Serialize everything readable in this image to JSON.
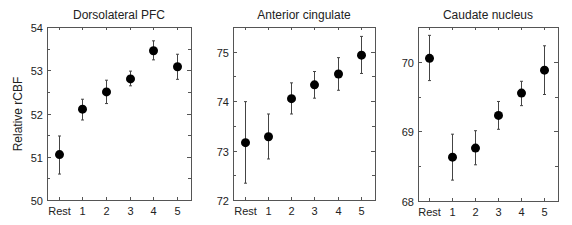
{
  "figure": {
    "ylabel": "Relative rCBF"
  },
  "chart_data": [
    {
      "type": "scatter",
      "title": "Dorsolateral PFC",
      "xlabel": "",
      "ylabel": "Relative rCBF",
      "categories": [
        "Rest",
        "1",
        "2",
        "3",
        "4",
        "5"
      ],
      "values": [
        51.05,
        52.1,
        52.5,
        52.8,
        53.45,
        53.08
      ],
      "err_low": [
        50.6,
        51.85,
        52.23,
        52.64,
        53.24,
        52.79
      ],
      "err_high": [
        51.48,
        52.33,
        52.77,
        52.98,
        53.68,
        53.37
      ],
      "ylim": [
        50,
        54
      ],
      "yticks": [
        50,
        51,
        52,
        53,
        54
      ],
      "yminor": [
        50.5,
        51.5,
        52.5,
        53.5
      ],
      "grid": false,
      "frame": {
        "x0": 47,
        "y0": 27,
        "x1": 191,
        "y1": 200
      }
    },
    {
      "type": "scatter",
      "title": "Anterior cingulate",
      "xlabel": "",
      "ylabel": "",
      "categories": [
        "Rest",
        "1",
        "2",
        "3",
        "4",
        "5"
      ],
      "values": [
        73.16,
        73.28,
        74.05,
        74.33,
        74.55,
        74.93
      ],
      "err_low": [
        72.34,
        72.83,
        73.74,
        74.06,
        74.22,
        74.56
      ],
      "err_high": [
        73.99,
        73.74,
        74.37,
        74.6,
        74.88,
        75.31
      ],
      "ylim": [
        72,
        75.5
      ],
      "yticks": [
        72,
        73,
        74,
        75
      ],
      "yminor": [
        72.5,
        73.5,
        74.5
      ],
      "grid": false,
      "frame": {
        "x0": 233,
        "y0": 27,
        "x1": 375,
        "y1": 200
      }
    },
    {
      "type": "scatter",
      "title": "Caudate nucleus",
      "xlabel": "",
      "ylabel": "",
      "categories": [
        "Rest",
        "1",
        "2",
        "3",
        "4",
        "5"
      ],
      "values": [
        70.05,
        68.63,
        68.76,
        69.23,
        69.55,
        69.88
      ],
      "err_low": [
        69.73,
        68.3,
        68.52,
        69.03,
        69.37,
        69.53
      ],
      "err_high": [
        70.38,
        68.96,
        69.01,
        69.43,
        69.72,
        70.23
      ],
      "ylim": [
        68,
        70.5
      ],
      "yticks": [
        68,
        69,
        70
      ],
      "yminor": [
        68.5,
        69.5
      ],
      "grid": false,
      "frame": {
        "x0": 418,
        "y0": 27,
        "x1": 558,
        "y1": 201
      }
    }
  ]
}
